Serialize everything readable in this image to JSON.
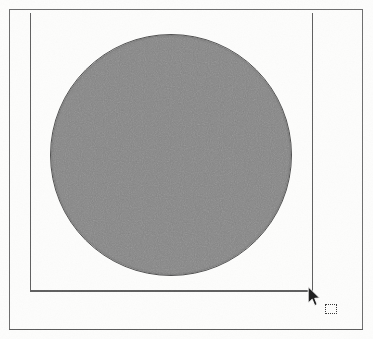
{
  "document": {
    "type": "scanned-figure-page",
    "background_color": "#fdfdfc",
    "page_border_color": "#6d6d6d",
    "caption": ""
  },
  "outer_frame": {
    "name": "page-border",
    "x": 9,
    "y": 9,
    "width": 354,
    "height": 321,
    "stroke_color": "#6d6d6d",
    "stroke_width": 1.5
  },
  "inner_frame": {
    "name": "drawing-frame",
    "open_side": "top",
    "stroke_color": "#5f5f5f",
    "stroke_width": 1.4,
    "left_x": 30,
    "right_x": 312,
    "top_y": 13,
    "bottom_y": 291
  },
  "shape": {
    "name": "filled-circle",
    "kind": "circle",
    "center_x": 171,
    "center_y": 155,
    "diameter": 240,
    "fill_color": "#858585",
    "outline_color": "#4e4e4e",
    "texture": "scanned-halftone-noise"
  },
  "cursor": {
    "name": "mouse-pointer",
    "kind": "arrow",
    "x": 307,
    "y": 286,
    "fill_color": "#202020",
    "outline_color": "#ffffff"
  },
  "marquee_hint": {
    "name": "selection-marquee",
    "x": 325,
    "y": 304,
    "width": 12,
    "height": 10,
    "stroke_style": "dotted",
    "stroke_color": "#3a3a3a"
  },
  "labels": {
    "screen_title": "",
    "annotations": []
  }
}
